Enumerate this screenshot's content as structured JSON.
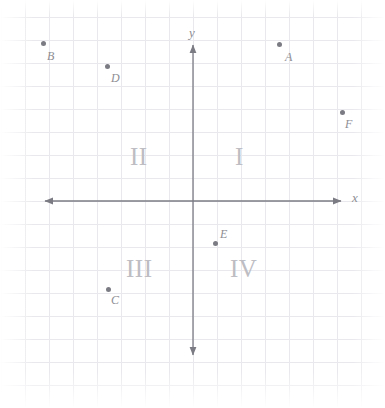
{
  "figure": {
    "kind": "cartesian-coordinate-plane",
    "width": 385,
    "height": 408,
    "origin": {
      "x": 193,
      "y": 201
    },
    "grid": {
      "visible": true,
      "spacing_x": 24,
      "spacing_y": 23,
      "color": "#e9e9ed"
    },
    "axes": {
      "color": "#7b7b84",
      "x_label": "x",
      "y_label": "y",
      "x_start": {
        "x": 45,
        "y": 201
      },
      "x_end": {
        "x": 341,
        "y": 201
      },
      "y_start": {
        "x": 193,
        "y": 45
      },
      "y_end": {
        "x": 193,
        "y": 355
      },
      "arrows": "both-ends-both-axes"
    },
    "quadrant_labels": [
      {
        "name": "I",
        "label": "I",
        "x": 240,
        "y": 156
      },
      {
        "name": "II",
        "label": "II",
        "x": 142,
        "y": 156
      },
      {
        "name": "III",
        "label": "III",
        "x": 143,
        "y": 268
      },
      {
        "name": "IV",
        "label": "IV",
        "x": 246,
        "y": 268
      }
    ],
    "points": [
      {
        "label": "A",
        "px": 279,
        "py": 44,
        "label_px": 285,
        "label_py": 51,
        "grid_x": 3.6,
        "grid_y": 6.8,
        "color": "#7b7b84"
      },
      {
        "label": "B",
        "px": 43,
        "py": 43,
        "label_px": 47,
        "label_py": 50,
        "grid_x": -6.2,
        "grid_y": 6.9,
        "color": "#7b7b84"
      },
      {
        "label": "C",
        "px": 108,
        "py": 289,
        "label_px": 111,
        "label_py": 294,
        "grid_x": -3.5,
        "grid_y": -3.8,
        "color": "#7b7b84"
      },
      {
        "label": "D",
        "px": 107,
        "py": 66,
        "label_px": 111,
        "label_py": 72,
        "grid_x": -3.6,
        "grid_y": 5.9,
        "color": "#7b7b84"
      },
      {
        "label": "E",
        "px": 215,
        "py": 243,
        "label_px": 220,
        "label_py": 228,
        "grid_x": 0.9,
        "grid_y": -1.8,
        "color": "#7b7b84"
      },
      {
        "label": "F",
        "px": 342,
        "py": 112,
        "label_px": 345,
        "label_py": 118,
        "grid_x": 6.2,
        "grid_y": 3.9,
        "color": "#7b7b84"
      }
    ]
  },
  "chart_data": {
    "type": "scatter",
    "title": "",
    "xlabel": "x",
    "ylabel": "y",
    "grid": true,
    "legend": "none",
    "xlim": [
      -6.2,
      6.2
    ],
    "ylim": [
      -6.8,
      6.9
    ],
    "annotations": [
      "I",
      "II",
      "III",
      "IV"
    ],
    "series": [
      {
        "name": "labeled points",
        "point_labels": [
          "A",
          "B",
          "C",
          "D",
          "E",
          "F"
        ],
        "x": [
          3.6,
          -6.2,
          -3.5,
          -3.6,
          0.9,
          6.2
        ],
        "y": [
          6.8,
          6.9,
          -3.8,
          5.9,
          -1.8,
          3.9
        ]
      }
    ]
  }
}
